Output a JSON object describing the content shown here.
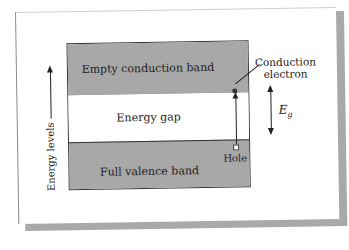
{
  "diagram": {
    "energy_axis": {
      "label": "Energy levels",
      "direction": "up"
    },
    "bands": [
      {
        "id": "conduction",
        "label": "Empty conduction band",
        "fill": "#a8a8a8"
      },
      {
        "id": "gap",
        "label": "Energy gap",
        "fill": "#ffffff"
      },
      {
        "id": "valence",
        "label": "Full valence band",
        "fill": "#a8a8a8"
      }
    ],
    "annotations": {
      "conduction_electron_line1": "Conduction",
      "conduction_electron_line2": "electron",
      "hole": "Hole",
      "gap_symbol": "E",
      "gap_subscript": "g"
    },
    "colors": {
      "line": "#222222",
      "card_shadow": "#a9a9a9",
      "band_gray": "#a8a8a8"
    }
  }
}
